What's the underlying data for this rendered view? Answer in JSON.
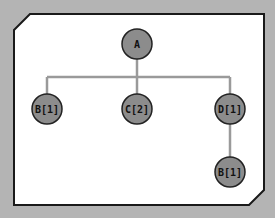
{
  "diagram": {
    "type": "tree",
    "colors": {
      "background": "#b4b4b4",
      "panel_fill": "#ffffff",
      "panel_border": "#1a1a1a",
      "node_fill": "#8c8c8c",
      "node_stroke": "#222222",
      "edge": "#9a9a9a",
      "label": "#111111"
    },
    "root": {
      "label": "A"
    },
    "children": [
      {
        "label": "B[1]"
      },
      {
        "label": "C[2]"
      },
      {
        "label": "D[1]"
      }
    ],
    "grandchildren": [
      {
        "parent": "D[1]",
        "label": "B[1]"
      }
    ],
    "edges": [
      [
        "A",
        "B[1]"
      ],
      [
        "A",
        "C[2]"
      ],
      [
        "A",
        "D[1]"
      ],
      [
        "D[1]",
        "B[1]"
      ]
    ]
  }
}
